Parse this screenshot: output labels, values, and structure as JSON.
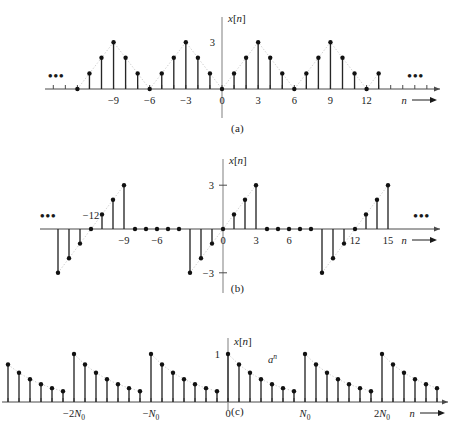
{
  "figure": {
    "title": "",
    "panels": [
      {
        "id": "a",
        "caption": "(a)",
        "ylabel": "x[n]",
        "xlabel": "n",
        "ellipsis_left": "•••",
        "ellipsis_right": "•••",
        "ytick_labels": [
          "3"
        ],
        "xtick_labels": [
          "−9",
          "−6",
          "−3",
          "0",
          "3",
          "6",
          "9",
          "12"
        ]
      },
      {
        "id": "b",
        "caption": "(b)",
        "ylabel": "x[n]",
        "xlabel": "n",
        "ellipsis_left": "•••",
        "ellipsis_right": "•••",
        "ytick_labels": [
          "3",
          "−3"
        ],
        "xtick_labels": [
          "−12",
          "−9",
          "−6",
          "0",
          "3",
          "6",
          "12",
          "15"
        ]
      },
      {
        "id": "c",
        "caption": "(c)",
        "ylabel": "x[n]",
        "xlabel": "n",
        "annotation": "a",
        "annotation_exponent": "n",
        "ytick_labels": [
          "1"
        ],
        "xtick_labels": [
          "−2N",
          "−N",
          "0",
          "N",
          "2N"
        ],
        "xtick_subscript": "0"
      }
    ]
  },
  "colors": {
    "stem": "#262626",
    "dot": "#111111",
    "axis": "#4a4a4a",
    "vaxis": "#8a8a8a",
    "envelope": "#c9c9c9",
    "background": "#ffffff"
  },
  "chart_data": [
    {
      "type": "stem",
      "id": "a",
      "title": "",
      "xlabel": "n",
      "ylabel": "x[n]",
      "description": "Periodic triangular discrete-time signal, period 6, peak value 3 at multiples of 6",
      "period": 6,
      "peak": 3,
      "xlim": [
        -12,
        14
      ],
      "ylim": [
        0,
        3
      ],
      "yticks": [
        3
      ],
      "xticks": [
        -9,
        -6,
        -3,
        0,
        3,
        6,
        9,
        12
      ],
      "grid": false,
      "envelope": "dotted triangular envelope",
      "x": [
        -12,
        -11,
        -10,
        -9,
        -8,
        -7,
        -6,
        -5,
        -4,
        -3,
        -2,
        -1,
        0,
        1,
        2,
        3,
        4,
        5,
        6,
        7,
        8,
        9,
        10,
        11,
        12,
        13
      ],
      "values": [
        0,
        1,
        2,
        3,
        2,
        1,
        0,
        1,
        2,
        3,
        2,
        1,
        0,
        1,
        2,
        3,
        2,
        1,
        0,
        1,
        2,
        3,
        2,
        1,
        0,
        1
      ]
    },
    {
      "type": "stem",
      "id": "b",
      "title": "",
      "xlabel": "n",
      "ylabel": "x[n]",
      "description": "Periodic sawtooth discrete-time signal, period 12, ramp from -3 to 3 then zero",
      "period": 12,
      "xlim": [
        -15,
        16
      ],
      "ylim": [
        -3,
        3
      ],
      "yticks": [
        3,
        -3
      ],
      "xticks": [
        -12,
        -9,
        -6,
        0,
        3,
        6,
        12,
        15
      ],
      "grid": false,
      "envelope": "dotted sawtooth ramp envelope",
      "x": [
        -15,
        -14,
        -13,
        -12,
        -11,
        -10,
        -9,
        -8,
        -7,
        -6,
        -5,
        -4,
        -3,
        -2,
        -1,
        0,
        1,
        2,
        3,
        4,
        5,
        6,
        7,
        8,
        9,
        10,
        11,
        12,
        13,
        14,
        15
      ],
      "values": [
        -3,
        -2,
        -1,
        0,
        1,
        2,
        3,
        0,
        0,
        0,
        0,
        0,
        -3,
        -2,
        -1,
        0,
        1,
        2,
        3,
        0,
        0,
        0,
        0,
        0,
        -3,
        -2,
        -1,
        0,
        1,
        2,
        3
      ]
    },
    {
      "type": "stem",
      "id": "c",
      "title": "",
      "xlabel": "n",
      "ylabel": "x[n]",
      "description": "Periodic decaying exponential a^n with period N0, peak value 1 at multiples of N0",
      "period_label": "N0",
      "samples_per_period": 7,
      "peak": 1,
      "decay_base": 0.78,
      "ylim": [
        0,
        1
      ],
      "yticks": [
        1
      ],
      "xticks_labels": [
        "-2N0",
        "-N0",
        "0",
        "N0",
        "2N0"
      ],
      "grid": false,
      "annotation": "a^n",
      "envelope": "dotted exponential decay envelope",
      "x": [
        -21,
        -20,
        -19,
        -18,
        -17,
        -16,
        -15,
        -14,
        -13,
        -12,
        -11,
        -10,
        -9,
        -8,
        -7,
        -6,
        -5,
        -4,
        -3,
        -2,
        -1,
        0,
        1,
        2,
        3,
        4,
        5,
        6,
        7,
        8,
        9,
        10,
        11,
        12,
        13,
        14,
        15,
        16,
        17,
        18,
        19,
        20
      ],
      "values": [
        1.0,
        0.78,
        0.608,
        0.475,
        0.37,
        0.289,
        0.225,
        1.0,
        0.78,
        0.608,
        0.475,
        0.37,
        0.289,
        0.225,
        1.0,
        0.78,
        0.608,
        0.475,
        0.37,
        0.289,
        0.225,
        1.0,
        0.78,
        0.608,
        0.475,
        0.37,
        0.289,
        0.225,
        1.0,
        0.78,
        0.608,
        0.475,
        0.37,
        0.289,
        0.225,
        1.0,
        0.78,
        0.608,
        0.475,
        0.37,
        0.289,
        0.225
      ]
    }
  ]
}
